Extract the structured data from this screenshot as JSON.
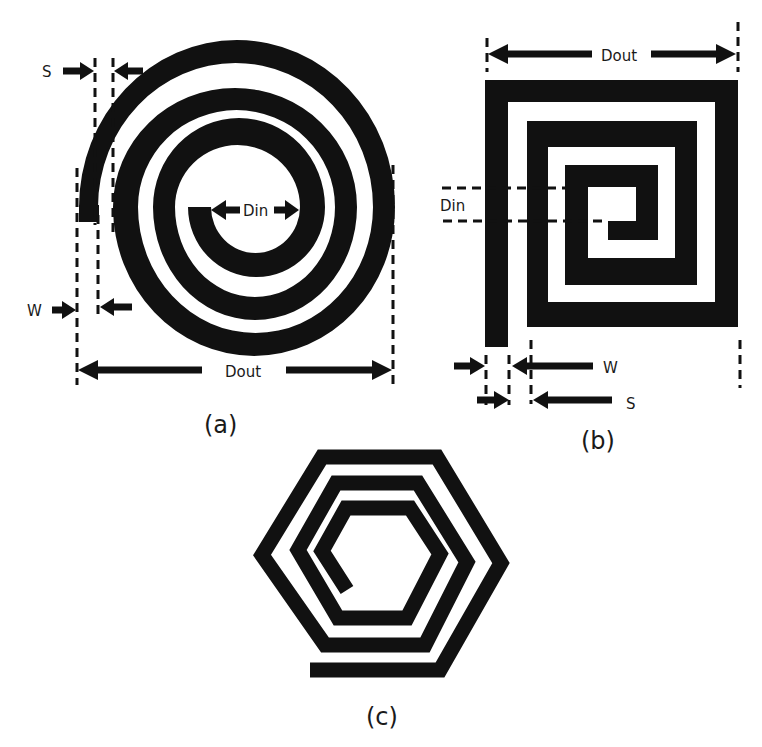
{
  "figure": {
    "panels": [
      {
        "id": "a",
        "caption": "(a)",
        "shape": "circular spiral inductor",
        "labels": {
          "spacing": "S",
          "width": "W",
          "inner_diameter": "Din",
          "outer_diameter": "Dout"
        },
        "turns": 3
      },
      {
        "id": "b",
        "caption": "(b)",
        "shape": "square spiral inductor",
        "labels": {
          "spacing": "S",
          "width": "W",
          "inner_diameter": "Din",
          "outer_diameter": "Dout"
        },
        "turns": 3
      },
      {
        "id": "c",
        "caption": "(c)",
        "shape": "hexagonal spiral inductor",
        "turns": 3
      }
    ],
    "colors": {
      "trace": "#111111",
      "background": "#ffffff",
      "text": "#1a1a1a"
    }
  }
}
